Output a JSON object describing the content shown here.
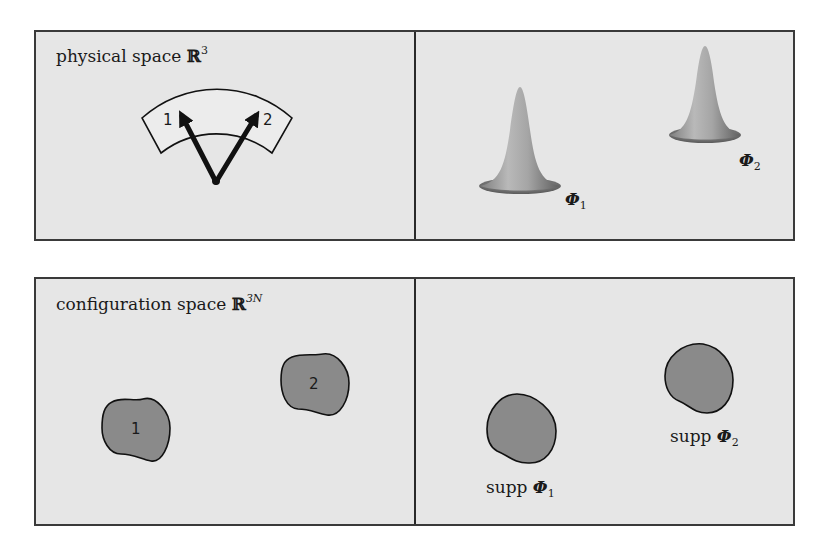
{
  "figure": {
    "top_row": {
      "left_panel": {
        "title": "physical space ",
        "title_symbol": "ℝ",
        "title_superscript": "3",
        "particle_labels": [
          "1",
          "2"
        ]
      },
      "right_panel": {
        "bumps": [
          {
            "symbol": "Φ",
            "subscript": "1"
          },
          {
            "symbol": "Φ",
            "subscript": "2"
          }
        ]
      }
    },
    "bottom_row": {
      "left_panel": {
        "title": "configuration space ",
        "title_symbol": "ℝ",
        "title_superscript": "3N",
        "region_labels": [
          "1",
          "2"
        ]
      },
      "right_panel": {
        "supports": [
          {
            "prefix": "supp ",
            "symbol": "Φ",
            "subscript": "1"
          },
          {
            "prefix": "supp ",
            "symbol": "Φ",
            "subscript": "2"
          }
        ]
      }
    },
    "colors": {
      "panel_background": "#e6e6e6",
      "border": "#3a3a3a",
      "blob_fill": "#8a8a8a",
      "ink": "#1a1a1a"
    }
  }
}
